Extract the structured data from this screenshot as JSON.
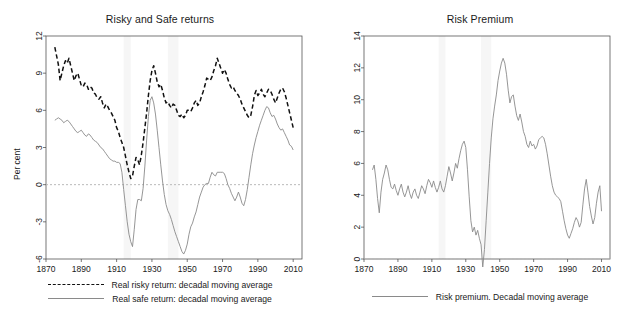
{
  "figure": {
    "panels": [
      {
        "id": "risky-and-safe-returns",
        "title": "Risky and Safe returns",
        "ylabel": "Per cent",
        "legend": [
          {
            "style": "dashed",
            "label": "Real risky return: decadal moving average"
          },
          {
            "style": "solid",
            "label": "Real safe return: decadal moving average"
          }
        ]
      },
      {
        "id": "risk-premium",
        "title": "Risk Premium",
        "ylabel": "Per cent",
        "legend": [
          {
            "style": "solid",
            "label": "Risk premium. Decadal moving average"
          }
        ]
      }
    ]
  },
  "colors": {
    "risky_line": "#111111",
    "safe_line": "#8a8a8a",
    "premium_line": "#8a8a8a",
    "zero_line": "#b9b9b9",
    "axis": "#555555",
    "shade_band": "#f6f6f6",
    "background": "#ffffff"
  },
  "chart_data": [
    {
      "type": "line",
      "title": "Risky and Safe returns",
      "xlabel": "",
      "ylabel": "Per cent",
      "xlim": [
        1870,
        2015
      ],
      "ylim": [
        -6,
        12
      ],
      "xticks": [
        1870,
        1890,
        1910,
        1930,
        1950,
        1970,
        1990,
        2010
      ],
      "yticks": [
        -6,
        -3,
        0,
        3,
        6,
        9,
        12
      ],
      "grid": false,
      "zero_line": 0,
      "legend_position": "below",
      "shaded_bands": [
        [
          1914,
          1918
        ],
        [
          1939,
          1945
        ]
      ],
      "series": [
        {
          "name": "Real risky return: decadal moving average",
          "style": "dashed",
          "x": [
            1875,
            1876,
            1877,
            1878,
            1879,
            1880,
            1881,
            1882,
            1883,
            1884,
            1885,
            1886,
            1887,
            1888,
            1889,
            1890,
            1891,
            1892,
            1893,
            1894,
            1895,
            1896,
            1897,
            1898,
            1899,
            1900,
            1901,
            1902,
            1903,
            1904,
            1905,
            1906,
            1907,
            1908,
            1909,
            1910,
            1911,
            1912,
            1913,
            1914,
            1915,
            1916,
            1917,
            1918,
            1919,
            1920,
            1921,
            1922,
            1923,
            1924,
            1925,
            1926,
            1927,
            1928,
            1929,
            1930,
            1931,
            1932,
            1933,
            1934,
            1935,
            1936,
            1937,
            1938,
            1939,
            1940,
            1941,
            1942,
            1943,
            1944,
            1945,
            1946,
            1947,
            1948,
            1949,
            1950,
            1951,
            1952,
            1953,
            1954,
            1955,
            1956,
            1957,
            1958,
            1959,
            1960,
            1961,
            1962,
            1963,
            1964,
            1965,
            1966,
            1967,
            1968,
            1969,
            1970,
            1971,
            1972,
            1973,
            1974,
            1975,
            1976,
            1977,
            1978,
            1979,
            1980,
            1981,
            1982,
            1983,
            1984,
            1985,
            1986,
            1987,
            1988,
            1989,
            1990,
            1991,
            1992,
            1993,
            1994,
            1995,
            1996,
            1997,
            1998,
            1999,
            2000,
            2001,
            2002,
            2003,
            2004,
            2005,
            2006,
            2007,
            2008,
            2009,
            2010
          ],
          "y": [
            11.1,
            10.4,
            9.7,
            8.4,
            9.0,
            9.6,
            10.0,
            9.8,
            10.2,
            9.6,
            9.0,
            8.4,
            8.8,
            9.0,
            8.5,
            8.0,
            7.9,
            8.2,
            8.1,
            7.7,
            7.9,
            7.8,
            7.4,
            7.3,
            7.0,
            6.9,
            7.1,
            6.6,
            6.2,
            6.5,
            6.3,
            6.0,
            5.8,
            5.5,
            5.2,
            4.6,
            4.3,
            3.8,
            3.4,
            3.0,
            2.3,
            1.6,
            1.0,
            0.5,
            0.7,
            1.5,
            2.2,
            2.0,
            1.6,
            2.4,
            3.4,
            4.6,
            5.8,
            7.2,
            8.4,
            9.2,
            9.6,
            9.0,
            8.3,
            7.9,
            8.1,
            7.6,
            7.0,
            6.6,
            6.7,
            6.4,
            6.2,
            6.5,
            6.4,
            6.0,
            5.6,
            5.5,
            5.7,
            5.4,
            5.6,
            6.0,
            6.0,
            5.9,
            6.2,
            6.6,
            6.8,
            6.4,
            6.6,
            7.1,
            7.5,
            8.0,
            8.6,
            8.5,
            8.4,
            8.7,
            9.2,
            9.6,
            10.2,
            9.8,
            9.4,
            9.0,
            9.3,
            9.0,
            8.5,
            8.1,
            7.8,
            7.9,
            7.6,
            7.4,
            7.2,
            6.9,
            6.5,
            6.2,
            5.9,
            5.6,
            5.4,
            5.6,
            6.3,
            7.2,
            7.6,
            7.2,
            7.4,
            7.7,
            7.3,
            7.1,
            7.4,
            7.7,
            7.6,
            7.3,
            6.9,
            6.6,
            7.0,
            7.4,
            7.7,
            7.8,
            7.5,
            7.0,
            6.4,
            5.8,
            5.2,
            4.6,
            4.2,
            4.8,
            5.4,
            6.0
          ]
        },
        {
          "name": "Real safe return: decadal moving average",
          "style": "solid",
          "x": [
            1875,
            1876,
            1877,
            1878,
            1879,
            1880,
            1881,
            1882,
            1883,
            1884,
            1885,
            1886,
            1887,
            1888,
            1889,
            1890,
            1891,
            1892,
            1893,
            1894,
            1895,
            1896,
            1897,
            1898,
            1899,
            1900,
            1901,
            1902,
            1903,
            1904,
            1905,
            1906,
            1907,
            1908,
            1909,
            1910,
            1911,
            1912,
            1913,
            1914,
            1915,
            1916,
            1917,
            1918,
            1919,
            1920,
            1921,
            1922,
            1923,
            1924,
            1925,
            1926,
            1927,
            1928,
            1929,
            1930,
            1931,
            1932,
            1933,
            1934,
            1935,
            1936,
            1937,
            1938,
            1939,
            1940,
            1941,
            1942,
            1943,
            1944,
            1945,
            1946,
            1947,
            1948,
            1949,
            1950,
            1951,
            1952,
            1953,
            1954,
            1955,
            1956,
            1957,
            1958,
            1959,
            1960,
            1961,
            1962,
            1963,
            1964,
            1965,
            1966,
            1967,
            1968,
            1969,
            1970,
            1971,
            1972,
            1973,
            1974,
            1975,
            1976,
            1977,
            1978,
            1979,
            1980,
            1981,
            1982,
            1983,
            1984,
            1985,
            1986,
            1987,
            1988,
            1989,
            1990,
            1991,
            1992,
            1993,
            1994,
            1995,
            1996,
            1997,
            1998,
            1999,
            2000,
            2001,
            2002,
            2003,
            2004,
            2005,
            2006,
            2007,
            2008,
            2009,
            2010
          ],
          "y": [
            5.2,
            5.3,
            5.4,
            5.3,
            5.2,
            5.0,
            5.1,
            5.2,
            5.1,
            4.9,
            4.7,
            4.5,
            4.3,
            4.2,
            4.3,
            4.4,
            4.2,
            4.0,
            3.9,
            4.1,
            4.0,
            3.8,
            3.6,
            3.5,
            3.4,
            3.2,
            3.0,
            2.9,
            2.7,
            2.5,
            2.3,
            2.1,
            2.0,
            1.9,
            1.9,
            1.8,
            1.8,
            1.7,
            1.0,
            -0.4,
            -1.7,
            -3.0,
            -4.0,
            -4.6,
            -5.0,
            -3.6,
            -2.0,
            -1.2,
            -1.2,
            -1.3,
            -0.3,
            1.5,
            3.6,
            5.5,
            6.8,
            7.1,
            6.6,
            5.7,
            4.4,
            3.0,
            1.6,
            0.3,
            -0.8,
            -1.6,
            -2.1,
            -2.4,
            -2.8,
            -3.3,
            -3.8,
            -4.2,
            -4.6,
            -5.0,
            -5.4,
            -5.6,
            -5.3,
            -4.8,
            -4.0,
            -3.4,
            -3.1,
            -2.6,
            -2.2,
            -1.6,
            -1.0,
            -0.6,
            -0.2,
            0.0,
            0.1,
            0.1,
            0.6,
            1.0,
            0.8,
            0.7,
            1.0,
            1.0,
            1.0,
            1.0,
            0.9,
            0.5,
            0.0,
            -0.3,
            -0.7,
            -1.0,
            -1.3,
            -1.0,
            -0.6,
            -1.0,
            -1.5,
            -1.7,
            -1.2,
            -0.4,
            0.6,
            1.6,
            2.5,
            3.2,
            3.8,
            4.3,
            4.8,
            5.2,
            5.6,
            6.0,
            6.3,
            6.2,
            5.8,
            5.5,
            5.6,
            5.3,
            4.9,
            4.6,
            4.4,
            4.5,
            4.2,
            3.9,
            3.6,
            3.2,
            3.1,
            2.8,
            2.4,
            2.0,
            2.4,
            2.2,
            1.8
          ]
        }
      ]
    },
    {
      "type": "line",
      "title": "Risk Premium",
      "xlabel": "",
      "ylabel": "Per cent",
      "xlim": [
        1870,
        2015
      ],
      "ylim": [
        0,
        14
      ],
      "xticks": [
        1870,
        1890,
        1910,
        1930,
        1950,
        1970,
        1990,
        2010
      ],
      "yticks": [
        0,
        2,
        4,
        6,
        8,
        10,
        12,
        14
      ],
      "grid": false,
      "zero_line": 0,
      "legend_position": "below",
      "shaded_bands": [
        [
          1914,
          1918
        ],
        [
          1939,
          1945
        ]
      ],
      "series": [
        {
          "name": "Risk premium. Decadal moving average",
          "style": "solid",
          "x": [
            1875,
            1876,
            1877,
            1878,
            1879,
            1880,
            1881,
            1882,
            1883,
            1884,
            1885,
            1886,
            1887,
            1888,
            1889,
            1890,
            1891,
            1892,
            1893,
            1894,
            1895,
            1896,
            1897,
            1898,
            1899,
            1900,
            1901,
            1902,
            1903,
            1904,
            1905,
            1906,
            1907,
            1908,
            1909,
            1910,
            1911,
            1912,
            1913,
            1914,
            1915,
            1916,
            1917,
            1918,
            1919,
            1920,
            1921,
            1922,
            1923,
            1924,
            1925,
            1926,
            1927,
            1928,
            1929,
            1930,
            1931,
            1932,
            1933,
            1934,
            1935,
            1936,
            1937,
            1938,
            1939,
            1940,
            1941,
            1942,
            1943,
            1944,
            1945,
            1946,
            1947,
            1948,
            1949,
            1950,
            1951,
            1952,
            1953,
            1954,
            1955,
            1956,
            1957,
            1958,
            1959,
            1960,
            1961,
            1962,
            1963,
            1964,
            1965,
            1966,
            1967,
            1968,
            1969,
            1970,
            1971,
            1972,
            1973,
            1974,
            1975,
            1976,
            1977,
            1978,
            1979,
            1980,
            1981,
            1982,
            1983,
            1984,
            1985,
            1986,
            1987,
            1988,
            1989,
            1990,
            1991,
            1992,
            1993,
            1994,
            1995,
            1996,
            1997,
            1998,
            1999,
            2000,
            2001,
            2002,
            2003,
            2004,
            2005,
            2006,
            2007,
            2008,
            2009,
            2010
          ],
          "y": [
            5.6,
            5.9,
            5.0,
            3.8,
            2.9,
            4.2,
            5.0,
            5.4,
            5.9,
            5.6,
            5.0,
            4.5,
            4.4,
            4.7,
            4.3,
            4.0,
            4.4,
            4.7,
            4.2,
            3.9,
            4.2,
            4.6,
            4.1,
            3.8,
            4.2,
            4.4,
            4.0,
            3.8,
            4.2,
            4.6,
            4.4,
            4.1,
            4.6,
            5.0,
            4.8,
            4.5,
            4.9,
            4.5,
            4.2,
            4.5,
            4.9,
            4.4,
            4.2,
            4.6,
            5.2,
            5.8,
            5.4,
            4.9,
            5.4,
            6.0,
            5.7,
            6.3,
            6.8,
            7.2,
            7.4,
            7.0,
            5.6,
            3.9,
            2.4,
            1.7,
            2.0,
            1.5,
            1.8,
            1.3,
            0.9,
            -0.5,
            0.6,
            2.4,
            4.2,
            6.0,
            7.6,
            8.8,
            9.6,
            10.3,
            11.2,
            11.8,
            12.3,
            12.6,
            12.3,
            11.6,
            10.6,
            9.8,
            10.2,
            10.3,
            9.6,
            9.0,
            8.7,
            9.1,
            8.6,
            8.0,
            7.7,
            7.2,
            7.0,
            7.4,
            7.1,
            7.2,
            6.9,
            7.1,
            7.5,
            7.6,
            7.7,
            7.6,
            7.2,
            6.6,
            5.9,
            5.2,
            4.6,
            4.2,
            4.0,
            3.9,
            3.8,
            3.6,
            3.0,
            2.4,
            1.9,
            1.5,
            1.3,
            1.6,
            1.9,
            2.3,
            2.6,
            2.4,
            2.0,
            2.3,
            3.4,
            4.4,
            5.0,
            4.2,
            3.3,
            2.7,
            2.2,
            2.6,
            3.5,
            4.2,
            4.6,
            3.0,
            3.6
          ]
        }
      ]
    }
  ]
}
